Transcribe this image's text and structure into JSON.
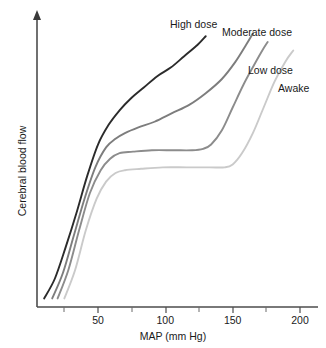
{
  "chart_data": {
    "type": "line",
    "title": "",
    "xlabel": "MAP (mm Hg)",
    "ylabel": "Cerebral blood flow",
    "xlim": [
      0,
      215
    ],
    "ylim": [
      0,
      100
    ],
    "xticks": [
      50,
      100,
      150,
      200
    ],
    "xtick_labels": [
      "50",
      "100",
      "150",
      "200"
    ],
    "xminor_ticks": [
      25,
      75,
      125,
      175
    ],
    "yticks": [],
    "ytick_labels": [],
    "grid": false,
    "legend_position": "inline-end-of-curve",
    "axis_style": "open-left-bottom-with-y-arrow",
    "series": [
      {
        "name": "High dose",
        "color": "#2b2b2b",
        "label_x": 170,
        "label_y": 18,
        "points": [
          [
            10,
            3
          ],
          [
            18,
            10
          ],
          [
            26,
            21
          ],
          [
            34,
            33
          ],
          [
            42,
            46
          ],
          [
            50,
            57
          ],
          [
            58,
            64
          ],
          [
            66,
            69
          ],
          [
            74,
            73
          ],
          [
            84,
            77
          ],
          [
            94,
            81
          ],
          [
            104,
            84
          ],
          [
            114,
            88
          ],
          [
            124,
            92
          ],
          [
            130,
            95
          ]
        ]
      },
      {
        "name": "Moderate dose",
        "color": "#7d7d7d",
        "label_x": 222,
        "label_y": 26,
        "points": [
          [
            16,
            3
          ],
          [
            24,
            12
          ],
          [
            32,
            25
          ],
          [
            40,
            38
          ],
          [
            48,
            49
          ],
          [
            56,
            56
          ],
          [
            63,
            59
          ],
          [
            70,
            61
          ],
          [
            80,
            63
          ],
          [
            92,
            65
          ],
          [
            105,
            68
          ],
          [
            118,
            71
          ],
          [
            130,
            75
          ],
          [
            142,
            80
          ],
          [
            152,
            86
          ],
          [
            160,
            92
          ],
          [
            165,
            96
          ]
        ]
      },
      {
        "name": "Low dose",
        "color": "#8c8c8c",
        "label_x": 248,
        "label_y": 64,
        "points": [
          [
            20,
            3
          ],
          [
            28,
            13
          ],
          [
            36,
            27
          ],
          [
            44,
            40
          ],
          [
            52,
            48
          ],
          [
            59,
            52
          ],
          [
            66,
            54
          ],
          [
            76,
            54.5
          ],
          [
            90,
            55
          ],
          [
            106,
            55
          ],
          [
            120,
            55
          ],
          [
            128,
            55.5
          ],
          [
            134,
            57
          ],
          [
            142,
            62
          ],
          [
            150,
            70
          ],
          [
            158,
            78
          ],
          [
            166,
            85
          ],
          [
            172,
            90
          ],
          [
            176,
            93
          ]
        ]
      },
      {
        "name": "Awake",
        "color": "#cacaca",
        "label_x": 278,
        "label_y": 82,
        "points": [
          [
            25,
            3
          ],
          [
            33,
            13
          ],
          [
            41,
            27
          ],
          [
            49,
            38
          ],
          [
            56,
            44
          ],
          [
            63,
            47
          ],
          [
            70,
            48
          ],
          [
            82,
            48.5
          ],
          [
            98,
            49
          ],
          [
            116,
            49
          ],
          [
            133,
            49
          ],
          [
            144,
            49
          ],
          [
            150,
            50
          ],
          [
            157,
            54
          ],
          [
            165,
            61
          ],
          [
            173,
            70
          ],
          [
            181,
            79
          ],
          [
            189,
            86
          ],
          [
            195,
            90
          ]
        ]
      }
    ]
  }
}
